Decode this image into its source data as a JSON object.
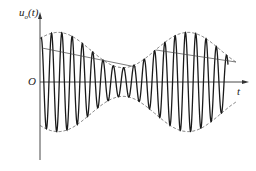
{
  "diagram": {
    "type": "amplitude-modulated waveform",
    "y_axis_label": "u",
    "y_axis_subscript": "o",
    "y_axis_suffix": "(t)",
    "origin_label": "O",
    "x_axis_label": "t",
    "colors": {
      "carrier": "#1a1a1a",
      "envelope": "#555555",
      "axes": "#333333",
      "leader": "#444444"
    }
  }
}
